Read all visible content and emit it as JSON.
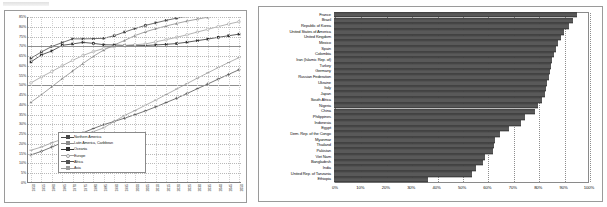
{
  "chart_data": [
    {
      "type": "line",
      "title": "",
      "xlabel": "",
      "ylabel": "",
      "ylim": [
        0,
        85
      ],
      "xlim": [
        1950,
        2050
      ],
      "grid": true,
      "legend_position": "inside-bottom-center",
      "ytick_labels": [
        "85%",
        "80%",
        "75%",
        "70%",
        "65%",
        "60%",
        "55%",
        "50%",
        "45%",
        "40%",
        "35%",
        "30%",
        "25%",
        "20%",
        "15%",
        "10%",
        "5%",
        "0%"
      ],
      "x": [
        1950,
        1955,
        1960,
        1965,
        1970,
        1975,
        1980,
        1985,
        1990,
        1995,
        2000,
        2005,
        2010,
        2015,
        2020,
        2025,
        2030,
        2035,
        2040,
        2045,
        2050
      ],
      "series": [
        {
          "name": "Northern America",
          "values": [
            63.9,
            67.1,
            69.9,
            71.9,
            73.8,
            73.8,
            73.9,
            74.1,
            75.4,
            77.3,
            79.1,
            80.7,
            82.0,
            83.3,
            84.4,
            85.4,
            86.2,
            87.0,
            87.8,
            88.5,
            89.1
          ],
          "marker": "square",
          "color": "#4a4a4a"
        },
        {
          "name": "Latin America, Caribbean",
          "values": [
            41.4,
            45.2,
            49.3,
            53.4,
            57.3,
            61.2,
            64.9,
            68.1,
            70.7,
            73.0,
            75.5,
            77.4,
            79.0,
            80.4,
            81.7,
            82.9,
            83.9,
            84.9,
            85.8,
            86.6,
            87.3
          ],
          "marker": "triangle",
          "color": "#8c8c8c"
        },
        {
          "name": "Oceania",
          "values": [
            62.0,
            65.6,
            67.6,
            70.5,
            71.2,
            72.0,
            71.5,
            70.8,
            70.7,
            70.4,
            70.5,
            70.4,
            70.7,
            71.0,
            71.4,
            72.1,
            72.9,
            73.7,
            74.6,
            75.4,
            76.2
          ],
          "marker": "square",
          "color": "#333333"
        },
        {
          "name": "Europe",
          "values": [
            51.3,
            54.3,
            57.1,
            60.0,
            62.8,
            65.3,
            67.3,
            68.9,
            69.8,
            70.4,
            70.8,
            71.2,
            72.3,
            73.4,
            74.6,
            75.9,
            77.3,
            78.7,
            80.1,
            81.4,
            82.6
          ],
          "marker": "circle",
          "color": "#a0a0a0"
        },
        {
          "name": "Africa",
          "values": [
            14.4,
            16.2,
            18.4,
            20.7,
            23.4,
            25.7,
            27.9,
            29.9,
            31.5,
            33.2,
            35.0,
            36.9,
            39.0,
            41.2,
            43.4,
            45.8,
            48.3,
            50.7,
            53.2,
            55.6,
            58.0
          ],
          "marker": "plus",
          "color": "#555555"
        },
        {
          "name": "Asia",
          "values": [
            16.8,
            18.4,
            20.6,
            22.4,
            23.7,
            24.8,
            26.3,
            28.3,
            31.5,
            34.6,
            37.1,
            39.8,
            42.5,
            45.3,
            48.1,
            50.9,
            53.7,
            56.4,
            59.1,
            61.7,
            64.2
          ],
          "marker": "dash",
          "color": "#9d9d9d"
        }
      ]
    },
    {
      "type": "bar",
      "orientation": "horizontal",
      "title": "",
      "xlabel": "",
      "ylabel": "",
      "xlim": [
        0,
        100
      ],
      "grid": true,
      "xtick_labels": [
        "0%",
        "10%",
        "20%",
        "30%",
        "40%",
        "50%",
        "60%",
        "70%",
        "80%",
        "90%",
        "100%"
      ],
      "bar_color": "#595959",
      "categories": [
        "France",
        "Brazil",
        "Republic of Korea",
        "United States of America",
        "United Kingdom",
        "Mexico",
        "Spain",
        "Colombia",
        "Iran (Islamic Rep. of)",
        "Turkey",
        "Germany",
        "Russian Federation",
        "Ukraine",
        "Italy",
        "Japan",
        "South Africa",
        "Nigeria",
        "China",
        "Philippines",
        "Indonesia",
        "Egypt",
        "Dem. Rep. of the Congo",
        "Myanmar",
        "Thailand",
        "Pakistan",
        "Viet Nam",
        "Bangladesh",
        "India",
        "United Rep. of Tanzania",
        "Ethiopia"
      ],
      "values": [
        95.5,
        94.0,
        92.5,
        90.5,
        89.5,
        88.0,
        87.5,
        86.5,
        86.0,
        85.5,
        85.0,
        84.5,
        84.0,
        83.5,
        83.0,
        82.0,
        80.5,
        79.0,
        75.0,
        73.5,
        69.0,
        65.5,
        63.5,
        63.0,
        62.5,
        59.5,
        58.5,
        56.0,
        54.5,
        37.0
      ]
    }
  ]
}
